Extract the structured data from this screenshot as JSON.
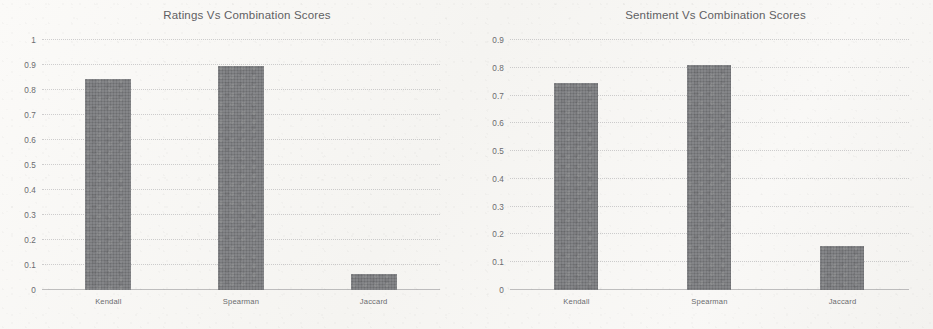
{
  "page": {
    "background_color": "#f7f6f4",
    "bar_color": "#76777a",
    "text_color": "#6a6b6e",
    "gridline_color": "#787880"
  },
  "charts": [
    {
      "id": "ratings-vs-combination-scores",
      "title": "Ratings Vs Combination Scores",
      "yticks": [
        "1",
        "0.9",
        "0.8",
        "0.7",
        "0.6",
        "0.5",
        "0.4",
        "0.3",
        "0.2",
        "0.1",
        "0"
      ],
      "categories": [
        "Kendall",
        "Spearman",
        "Jaccard"
      ],
      "values": [
        0.845,
        0.895,
        0.065
      ]
    },
    {
      "id": "sentiment-vs-combination-scores",
      "title": "Sentiment Vs Combination Scores",
      "yticks": [
        "0.9",
        "0.8",
        "0.7",
        "0.6",
        "0.5",
        "0.4",
        "0.3",
        "0.2",
        "0.1",
        "0"
      ],
      "categories": [
        "Kendall",
        "Spearman",
        "Jaccard"
      ],
      "values": [
        0.745,
        0.81,
        0.16
      ]
    }
  ],
  "chart_data": [
    {
      "type": "bar",
      "title": "Ratings Vs Combination Scores",
      "subtitle": "",
      "categories": [
        "Kendall",
        "Spearman",
        "Jaccard"
      ],
      "values": [
        0.845,
        0.895,
        0.065
      ],
      "xlabel": "",
      "ylabel": "",
      "ylim": [
        0,
        1
      ],
      "ytick_step": 0.1,
      "ytick_labels": [
        "0",
        "0.1",
        "0.2",
        "0.3",
        "0.4",
        "0.5",
        "0.6",
        "0.7",
        "0.8",
        "0.9",
        "1"
      ],
      "grid": true,
      "legend": false,
      "series": [
        {
          "name": "Combination Score",
          "values": [
            0.845,
            0.895,
            0.065
          ]
        }
      ]
    },
    {
      "type": "bar",
      "title": "Sentiment Vs Combination Scores",
      "subtitle": "",
      "categories": [
        "Kendall",
        "Spearman",
        "Jaccard"
      ],
      "values": [
        0.745,
        0.81,
        0.16
      ],
      "xlabel": "",
      "ylabel": "",
      "ylim": [
        0,
        0.9
      ],
      "ytick_step": 0.1,
      "ytick_labels": [
        "0",
        "0.1",
        "0.2",
        "0.3",
        "0.4",
        "0.5",
        "0.6",
        "0.7",
        "0.8",
        "0.9"
      ],
      "grid": true,
      "legend": false,
      "series": [
        {
          "name": "Combination Score",
          "values": [
            0.745,
            0.81,
            0.16
          ]
        }
      ]
    }
  ]
}
